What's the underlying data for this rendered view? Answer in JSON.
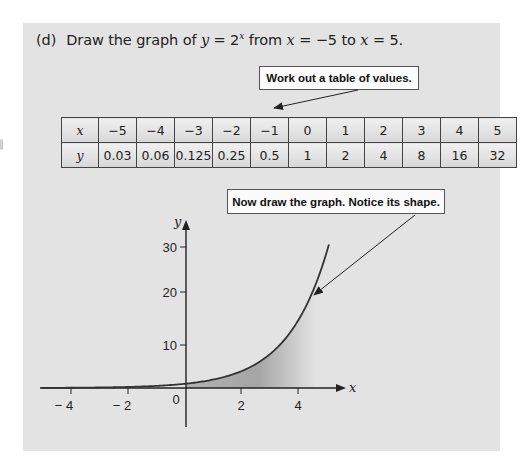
{
  "question": {
    "label": "(d)",
    "text_prefix": "Draw the graph of",
    "equation_var": "y",
    "equation_eq": " = 2",
    "equation_exp": "x",
    "text_mid": " from ",
    "range_start_var": "x",
    "range_start": " = −5 to ",
    "range_end_var": "x",
    "range_end": " = 5."
  },
  "callouts": {
    "table": "Work out a table of values.",
    "graph": "Now draw the graph. Notice its shape."
  },
  "table": {
    "row_x_label": "x",
    "row_y_label": "y",
    "x_values": [
      "−5",
      "−4",
      "−3",
      "−2",
      "−1",
      "0",
      "1",
      "2",
      "3",
      "4",
      "5"
    ],
    "y_values": [
      "0.03",
      "0.06",
      "0.125",
      "0.25",
      "0.5",
      "1",
      "2",
      "4",
      "8",
      "16",
      "32"
    ]
  },
  "axes": {
    "x_label": "x",
    "y_label": "y",
    "x_ticks": [
      {
        "value": -4,
        "label": "− 4"
      },
      {
        "value": -2,
        "label": "− 2"
      },
      {
        "value": 2,
        "label": "2"
      },
      {
        "value": 4,
        "label": "4"
      }
    ],
    "y_ticks": [
      {
        "value": 10,
        "label": "10"
      },
      {
        "value": 20,
        "label": "20"
      },
      {
        "value": 30,
        "label": "30"
      }
    ],
    "origin_label": "0"
  },
  "colors": {
    "panel": "#e3e3e3",
    "curve": "#333333",
    "shade_dark": "#8f8f8f",
    "shade_light": "#e3e3e3"
  },
  "chart_data": {
    "type": "line",
    "xlabel": "x",
    "ylabel": "y",
    "x": [
      -5,
      -4,
      -3,
      -2,
      -1,
      0,
      1,
      2,
      3,
      4,
      5
    ],
    "series": [
      {
        "name": "y = 2^x",
        "values": [
          0.03,
          0.06,
          0.125,
          0.25,
          0.5,
          1,
          2,
          4,
          8,
          16,
          32
        ]
      }
    ],
    "x_ticks": [
      -4,
      -2,
      0,
      2,
      4
    ],
    "y_ticks": [
      10,
      20,
      30
    ],
    "xlim": [
      -5.2,
      5.6
    ],
    "ylim": [
      -9,
      39
    ],
    "grid": false,
    "legend": "none",
    "annotations": [
      "Work out a table of values.",
      "Now draw the graph. Notice its shape."
    ]
  }
}
